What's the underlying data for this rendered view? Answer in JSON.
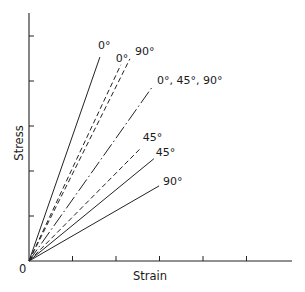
{
  "chart_data": {
    "type": "line",
    "title": "",
    "xlabel": "Strain",
    "ylabel": "Stress",
    "origin_label": "0",
    "grid": false,
    "legend": "inline labels at line ends",
    "x_ticks": [
      1,
      2,
      3,
      4,
      5
    ],
    "y_ticks": [
      1,
      2,
      3,
      4,
      5
    ],
    "xlim": [
      0,
      6.05
    ],
    "ylim": [
      0,
      5.5
    ],
    "tick_labels_shown": false,
    "series": [
      {
        "name": "0°",
        "style": "solid",
        "x": [
          0,
          1.63
        ],
        "y": [
          0,
          4.53
        ],
        "label": "0°"
      },
      {
        "name": "0° (dashed)",
        "style": "dashed",
        "x": [
          0,
          2.11
        ],
        "y": [
          0,
          4.36
        ],
        "label": "0°"
      },
      {
        "name": "90° (dashed)",
        "style": "dashed",
        "x": [
          0,
          2.32
        ],
        "y": [
          0,
          4.49
        ],
        "label": "90°"
      },
      {
        "name": "0°, 45°, 90°",
        "style": "dashdot",
        "x": [
          0,
          2.85
        ],
        "y": [
          0,
          3.89
        ],
        "label": "0°, 45°, 90°"
      },
      {
        "name": "45° (dashed)",
        "style": "dashed",
        "x": [
          0,
          2.57
        ],
        "y": [
          0,
          2.51
        ],
        "label": "45°"
      },
      {
        "name": "45°",
        "style": "solid",
        "x": [
          0,
          2.87
        ],
        "y": [
          0,
          2.27
        ],
        "label": "45°"
      },
      {
        "name": "90°",
        "style": "solid",
        "x": [
          0,
          2.99
        ],
        "y": [
          0,
          1.67
        ],
        "label": "90°"
      }
    ]
  },
  "layout": {
    "origin_px": [
      29,
      261
    ],
    "x_unit_px": 43.5,
    "y_unit_px": 45,
    "x_axis_end_px": 292,
    "y_axis_top_px": 13,
    "label_offsets": [
      [
        -2,
        -8
      ],
      [
        -5,
        -3
      ],
      [
        5,
        -4
      ],
      [
        4,
        -2
      ],
      [
        2,
        -7
      ],
      [
        2,
        -3
      ],
      [
        4,
        -1
      ]
    ]
  },
  "colors": {
    "ink": "#222222",
    "background": "#ffffff"
  }
}
